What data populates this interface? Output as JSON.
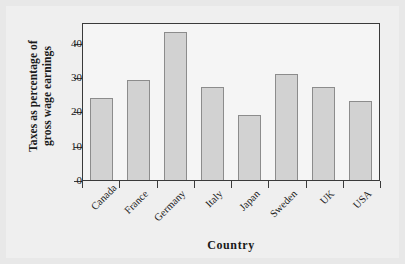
{
  "chart_data": {
    "type": "bar",
    "title": "",
    "xlabel": "Country",
    "ylabel_line1": "Taxes as percentage of",
    "ylabel_line2": "gross wage earnings",
    "ylabel": "Taxes as percentage of gross wage earnings",
    "categories": [
      "Canada",
      "France",
      "Germany",
      "Italy",
      "Japan",
      "Sweden",
      "UK",
      "USA"
    ],
    "values": [
      24,
      29,
      43,
      27,
      19,
      31,
      27,
      23
    ],
    "yticks": [
      0,
      10,
      20,
      30,
      40
    ],
    "ytick_labels": [
      "0",
      "10",
      "20",
      "30",
      "40"
    ],
    "ylim": [
      0,
      46
    ],
    "grid": false,
    "legend": null,
    "bar_fill_color": "#d2d2d2",
    "bar_border_color": "#8c8c8c",
    "frame_color": "#3a3a3a",
    "plot_background": "#f5f5f5",
    "figure_background": "#efefef",
    "page_background": "#e8e8e8"
  }
}
